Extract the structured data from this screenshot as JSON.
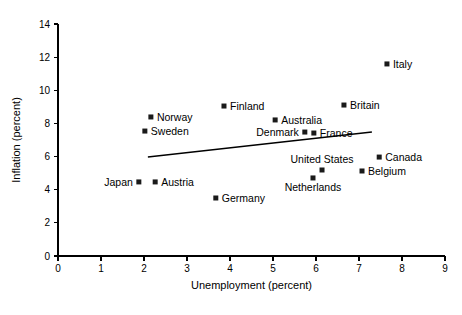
{
  "chart_data": {
    "type": "scatter",
    "title": "",
    "xlabel": "Unemployment (percent)",
    "ylabel": "Inflation (percent)",
    "xlim": [
      0,
      9
    ],
    "ylim": [
      0,
      14
    ],
    "xticks": [
      0,
      1,
      2,
      3,
      4,
      5,
      6,
      7,
      8,
      9
    ],
    "yticks": [
      0,
      2,
      4,
      6,
      8,
      10,
      12,
      14
    ],
    "xtick_labels": [
      "0",
      "1",
      "2",
      "3",
      "4",
      "5",
      "6",
      "7",
      "8",
      "9"
    ],
    "ytick_labels": [
      "0",
      "2",
      "4",
      "6",
      "8",
      "10",
      "12",
      "14"
    ],
    "grid": false,
    "legend": "none",
    "marker_style": "filled-square",
    "points": [
      {
        "label": "Italy",
        "x": 7.65,
        "y": 11.59,
        "label_pos": "right"
      },
      {
        "label": "Britain",
        "x": 6.65,
        "y": 9.11,
        "label_pos": "right"
      },
      {
        "label": "Finland",
        "x": 3.86,
        "y": 9.05,
        "label_pos": "right"
      },
      {
        "label": "Norway",
        "x": 2.16,
        "y": 8.39,
        "label_pos": "right"
      },
      {
        "label": "Australia",
        "x": 5.05,
        "y": 8.21,
        "label_pos": "right"
      },
      {
        "label": "Sweden",
        "x": 2.02,
        "y": 7.54,
        "label_pos": "right"
      },
      {
        "label": "Denmark",
        "x": 5.74,
        "y": 7.48,
        "label_pos": "left"
      },
      {
        "label": "France",
        "x": 5.95,
        "y": 7.42,
        "label_pos": "right"
      },
      {
        "label": "Canada",
        "x": 7.47,
        "y": 5.97,
        "label_pos": "right"
      },
      {
        "label": "United States",
        "x": 6.14,
        "y": 5.19,
        "label_pos": "above"
      },
      {
        "label": "Belgium",
        "x": 7.07,
        "y": 5.13,
        "label_pos": "right"
      },
      {
        "label": "Netherlands",
        "x": 5.93,
        "y": 4.71,
        "label_pos": "below"
      },
      {
        "label": "Japan",
        "x": 1.88,
        "y": 4.47,
        "label_pos": "left"
      },
      {
        "label": "Austria",
        "x": 2.26,
        "y": 4.47,
        "label_pos": "right"
      },
      {
        "label": "Germany",
        "x": 3.67,
        "y": 3.5,
        "label_pos": "right"
      }
    ],
    "trend_line": {
      "x0": 2.09,
      "y0": 5.97,
      "x1": 7.3,
      "y1": 7.48
    }
  },
  "colors": {
    "marker": "#1a1a1a",
    "axis": "#000000",
    "background": "#ffffff",
    "trend": "#000000"
  }
}
